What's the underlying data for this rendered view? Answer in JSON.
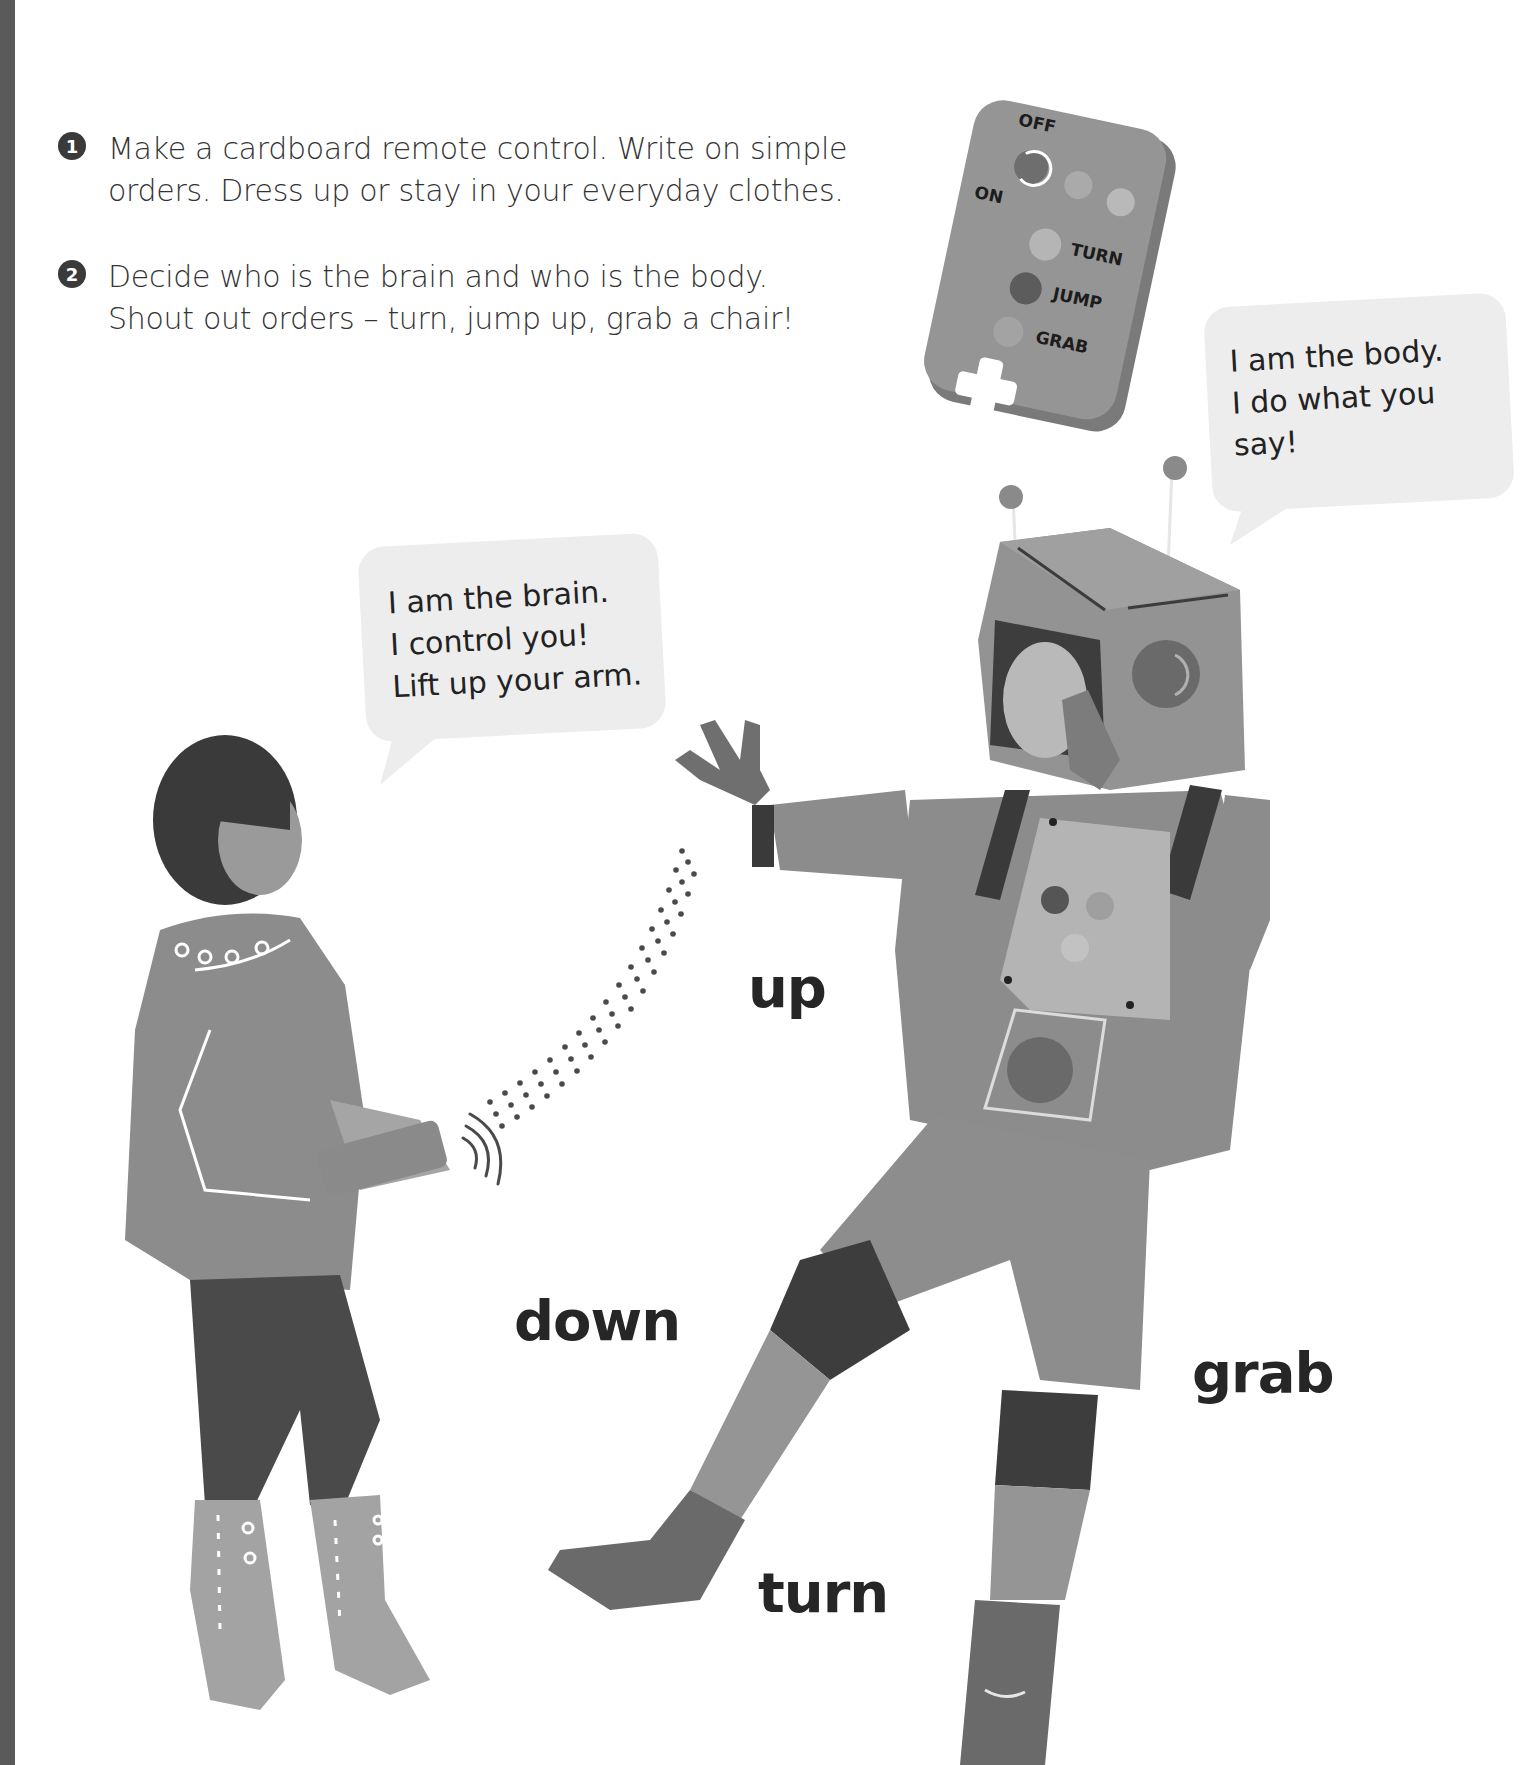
{
  "page": {
    "edge_strip_color": "#5a5a5a",
    "background": "#ffffff"
  },
  "steps": [
    {
      "number": "1",
      "lines": [
        "Make a cardboard remote control. Write on simple",
        "orders. Dress up or stay in your everyday clothes."
      ]
    },
    {
      "number": "2",
      "lines": [
        "Decide who is the brain and who is the body.",
        "Shout out orders – turn, jump up, grab a chair!"
      ]
    }
  ],
  "remote": {
    "labels": {
      "off": "OFF",
      "on": "ON",
      "turn": "TURN",
      "jump": "JUMP",
      "grab": "GRAB"
    }
  },
  "speech_bubbles": {
    "body": {
      "lines": [
        "I am the body.",
        "I do what you",
        "say!"
      ]
    },
    "brain": {
      "lines": [
        "I am the brain.",
        "I control you!",
        "Lift up your arm."
      ]
    }
  },
  "command_words": {
    "up": "up",
    "down": "down",
    "grab": "grab",
    "turn": "turn"
  },
  "icons": {
    "signal": "wifi-signal-icon",
    "dpad": "dpad-icon"
  }
}
